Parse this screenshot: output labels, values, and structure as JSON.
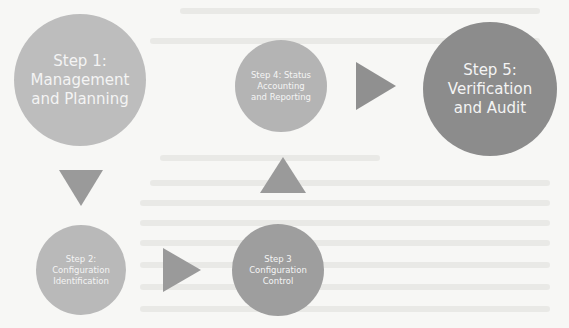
{
  "diagram": {
    "steps": [
      {
        "id": 1,
        "lines": [
          "Step 1:",
          "Management",
          "and Planning"
        ],
        "color": "#bdbdbd"
      },
      {
        "id": 2,
        "lines": [
          "Step 2:",
          "Configuration",
          "Identification"
        ],
        "color": "#b9b9b9"
      },
      {
        "id": 3,
        "lines": [
          "Step 3",
          "Configuration",
          "Control"
        ],
        "color": "#9e9e9e"
      },
      {
        "id": 4,
        "lines": [
          "Step 4: Status",
          "Accounting",
          "and Reporting"
        ],
        "color": "#b4b4b4"
      },
      {
        "id": 5,
        "lines": [
          "Step 5:",
          "Verification",
          "and Audit"
        ],
        "color": "#8c8c8c"
      }
    ],
    "arrows": [
      {
        "from": 1,
        "to": 2,
        "direction": "down"
      },
      {
        "from": 2,
        "to": 3,
        "direction": "right"
      },
      {
        "from": 3,
        "to": 4,
        "direction": "up"
      },
      {
        "from": 4,
        "to": 5,
        "direction": "right"
      }
    ],
    "arrow_color": "#9a9a9a",
    "text_color": "#f4f4f4",
    "background_color": "#f7f7f5"
  }
}
